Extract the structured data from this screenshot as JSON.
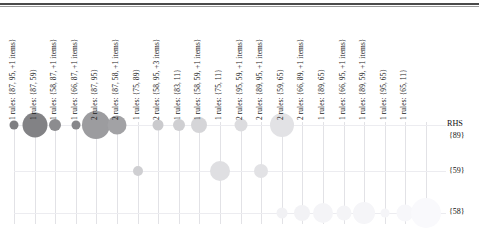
{
  "chart_data": {
    "type": "scatter",
    "xlabel": "LHS",
    "ylabel": "RHS",
    "legend_position": "none",
    "grid": true,
    "y_categories": [
      "{89}",
      "{59}",
      "{58}"
    ],
    "rhs_axis_label": "RHS",
    "categories": [
      "1 rules: {87, 95, +1 items}",
      "1 rules: {87, 59}",
      "1 rules: {58, 87, +1 items}",
      "1 rules: {66, 87, +1 items}",
      "2 rules: {87, 95}",
      "2 rules: {87, 58, +1 items}",
      "1 rules: {75, 89}",
      "2 rules: {58, 95, +3 items}",
      "1 rules: {83, 11}",
      "1 rules: {58, 59, +1 items}",
      "1 rules: {75, 11}",
      "2 rules: {95, 59, +1 items}",
      "2 rules: {89, 95, +1 items}",
      "2 rules: {59, 65}",
      "2 rules: {66, 89, +1 items}",
      "1 rules: {89, 65}",
      "1 rules: {66, 95, +1 items}",
      "1 rules: {89, 59, +1 items}",
      "1 rules: {95, 65}",
      "1 rules: {65, 11}"
    ],
    "series": [
      {
        "name": "{89}",
        "values": [
          0.32,
          0.95,
          0.4,
          0.3,
          0.92,
          0.62,
          0,
          0.33,
          0.38,
          0.5,
          0,
          0.44,
          0,
          0.74,
          0,
          0,
          0,
          0,
          0,
          0
        ]
      },
      {
        "name": "{59}",
        "values": [
          0,
          0,
          0,
          0,
          0,
          0,
          0.28,
          0,
          0,
          0,
          0.62,
          0,
          0.44,
          0,
          0,
          0,
          0,
          0,
          0,
          0
        ]
      },
      {
        "name": "{58}",
        "values": [
          0,
          0,
          0,
          0,
          0,
          0,
          0,
          0,
          0,
          0,
          0,
          0,
          0,
          0.3,
          0.52,
          0.4,
          0.62,
          0.22,
          0.45,
          0.86
        ]
      }
    ],
    "bubbles": [
      {
        "col": 0,
        "row": "{89}",
        "size": 9,
        "shade": 0.8
      },
      {
        "col": 1,
        "row": "{89}",
        "size": 25,
        "shade": 0.78
      },
      {
        "col": 2,
        "row": "{89}",
        "size": 12,
        "shade": 0.72
      },
      {
        "col": 3,
        "row": "{89}",
        "size": 9,
        "shade": 0.75
      },
      {
        "col": 4,
        "row": "{89}",
        "size": 28,
        "shade": 0.62
      },
      {
        "col": 5,
        "row": "{89}",
        "size": 19,
        "shade": 0.58
      },
      {
        "col": 7,
        "row": "{89}",
        "size": 11,
        "shade": 0.33
      },
      {
        "col": 8,
        "row": "{89}",
        "size": 12,
        "shade": 0.3
      },
      {
        "col": 9,
        "row": "{89}",
        "size": 16,
        "shade": 0.26
      },
      {
        "col": 11,
        "row": "{89}",
        "size": 13,
        "shade": 0.22
      },
      {
        "col": 13,
        "row": "{89}",
        "size": 24,
        "shade": 0.18
      },
      {
        "col": 6,
        "row": "{59}",
        "size": 10,
        "shade": 0.3
      },
      {
        "col": 10,
        "row": "{59}",
        "size": 20,
        "shade": 0.2
      },
      {
        "col": 12,
        "row": "{59}",
        "size": 14,
        "shade": 0.18
      },
      {
        "col": 13,
        "row": "{58}",
        "size": 11,
        "shade": 0.09
      },
      {
        "col": 14,
        "row": "{58}",
        "size": 16,
        "shade": 0.08
      },
      {
        "col": 15,
        "row": "{58}",
        "size": 20,
        "shade": 0.07
      },
      {
        "col": 16,
        "row": "{58}",
        "size": 15,
        "shade": 0.07
      },
      {
        "col": 17,
        "row": "{58}",
        "size": 22,
        "shade": 0.06
      },
      {
        "col": 18,
        "row": "{58}",
        "size": 9,
        "shade": 0.06
      },
      {
        "col": 19,
        "row": "{58}",
        "size": 17,
        "shade": 0.05
      },
      {
        "col": 20,
        "row": "{58}",
        "size": 30,
        "shade": 0.04
      }
    ],
    "colors": {
      "bubble_dark": "#6e6e6e",
      "bubble_light": "#d8d8dc",
      "grid": "#e6e6ea",
      "rule": "#4a4a4a",
      "text": "#111111"
    }
  }
}
